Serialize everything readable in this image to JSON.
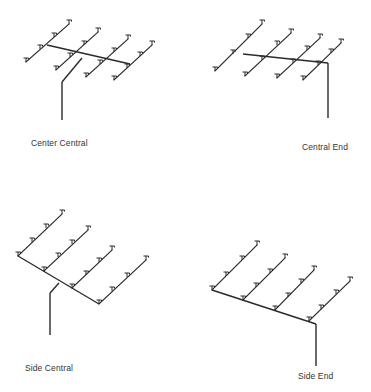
{
  "figure": {
    "panels": [
      {
        "id": "center-central",
        "label": "Center Central",
        "label_pos": [
          31,
          138
        ],
        "riser": [
          [
            62,
            82
          ],
          [
            62,
            120
          ]
        ],
        "feed_main": [
          [
            62,
            82
          ],
          [
            82,
            58
          ]
        ],
        "cross_main": [
          [
            47,
            45
          ],
          [
            130,
            64
          ]
        ],
        "branches": [
          {
            "from": [
              26,
              62
            ],
            "to": [
              69,
              24
            ],
            "heads": [
              [
                26,
                62
              ],
              [
                40,
                49
              ],
              [
                54,
                37
              ],
              [
                69,
                24
              ]
            ]
          },
          {
            "from": [
              56,
              70
            ],
            "to": [
              98,
              32
            ],
            "heads": [
              [
                56,
                70
              ],
              [
                70,
                57
              ],
              [
                84,
                45
              ],
              [
                98,
                32
              ]
            ]
          },
          {
            "from": [
              86,
              77
            ],
            "to": [
              128,
              39
            ],
            "heads": [
              [
                86,
                77
              ],
              [
                100,
                64
              ],
              [
                114,
                52
              ],
              [
                128,
                39
              ]
            ]
          },
          {
            "from": [
              114,
              80
            ],
            "to": [
              152,
              45
            ],
            "heads": [
              [
                114,
                80
              ],
              [
                127,
                68
              ],
              [
                140,
                56
              ],
              [
                152,
                45
              ]
            ]
          }
        ]
      },
      {
        "id": "central-end",
        "label": "Central End",
        "label_pos": [
          302,
          142
        ],
        "riser": [
          [
            328,
            63
          ],
          [
            328,
            118
          ]
        ],
        "feed_main": [],
        "cross_main": [
          [
            243,
            54
          ],
          [
            328,
            63
          ]
        ],
        "branches": [
          {
            "from": [
              215,
              71
            ],
            "to": [
              262,
              24
            ],
            "heads": [
              [
                215,
                71
              ],
              [
                233,
                54
              ],
              [
                248,
                38
              ],
              [
                262,
                24
              ]
            ]
          },
          {
            "from": [
              245,
              76
            ],
            "to": [
              291,
              33
            ],
            "heads": [
              [
                245,
                76
              ],
              [
                262,
                60
              ],
              [
                277,
                45
              ],
              [
                291,
                33
              ]
            ]
          },
          {
            "from": [
              277,
              78
            ],
            "to": [
              320,
              38
            ],
            "heads": [
              [
                277,
                78
              ],
              [
                293,
                63
              ],
              [
                307,
                50
              ],
              [
                320,
                38
              ]
            ]
          },
          {
            "from": [
              303,
              80
            ],
            "to": [
              341,
              43
            ],
            "heads": [
              [
                303,
                80
              ],
              [
                318,
                65
              ],
              [
                331,
                53
              ],
              [
                341,
                43
              ]
            ]
          }
        ]
      },
      {
        "id": "side-central",
        "label": "Side Central",
        "label_pos": [
          25,
          363
        ],
        "riser": [
          [
            50,
            293
          ],
          [
            50,
            335
          ]
        ],
        "feed_main": [
          [
            50,
            293
          ],
          [
            59,
            283
          ]
        ],
        "cross_main": [
          [
            18,
            256
          ],
          [
            99,
            304
          ]
        ],
        "branches": [
          {
            "from": [
              18,
              256
            ],
            "to": [
              62,
              214
            ],
            "heads": [
              [
                18,
                256
              ],
              [
                32,
                242
              ],
              [
                46,
                228
              ],
              [
                62,
                214
              ]
            ]
          },
          {
            "from": [
              44,
              271
            ],
            "to": [
              88,
              230
            ],
            "heads": [
              [
                44,
                271
              ],
              [
                58,
                257
              ],
              [
                72,
                244
              ],
              [
                88,
                230
              ]
            ]
          },
          {
            "from": [
              72,
              288
            ],
            "to": [
              112,
              250
            ],
            "heads": [
              [
                72,
                288
              ],
              [
                86,
                275
              ],
              [
                99,
                262
              ],
              [
                112,
                250
              ]
            ]
          },
          {
            "from": [
              99,
              304
            ],
            "to": [
              146,
              260
            ],
            "heads": [
              [
                99,
                304
              ],
              [
                112,
                291
              ],
              [
                127,
                277
              ],
              [
                146,
                260
              ]
            ]
          }
        ]
      },
      {
        "id": "side-end",
        "label": "Side End",
        "label_pos": [
          298,
          371
        ],
        "riser": [
          [
            316,
            324
          ],
          [
            316,
            366
          ]
        ],
        "feed_main": [],
        "cross_main": [
          [
            212,
            290
          ],
          [
            316,
            324
          ]
        ],
        "branches": [
          {
            "from": [
              212,
              290
            ],
            "to": [
              257,
              245
            ],
            "heads": [
              [
                212,
                290
              ],
              [
                226,
                276
              ],
              [
                242,
                260
              ],
              [
                257,
                245
              ]
            ]
          },
          {
            "from": [
              243,
              300
            ],
            "to": [
              285,
              258
            ],
            "heads": [
              [
                243,
                300
              ],
              [
                256,
                287
              ],
              [
                270,
                273
              ],
              [
                285,
                258
              ]
            ]
          },
          {
            "from": [
              275,
              310
            ],
            "to": [
              314,
              270
            ],
            "heads": [
              [
                275,
                310
              ],
              [
                288,
                297
              ],
              [
                301,
                283
              ],
              [
                314,
                270
              ]
            ]
          },
          {
            "from": [
              309,
              321
            ],
            "to": [
              350,
              281
            ],
            "heads": [
              [
                309,
                321
              ],
              [
                321,
                309
              ],
              [
                336,
                294
              ],
              [
                350,
                281
              ]
            ]
          }
        ]
      }
    ],
    "colors": {
      "line": "#2a2a2a",
      "label": "#333333",
      "background": "#ffffff"
    }
  }
}
